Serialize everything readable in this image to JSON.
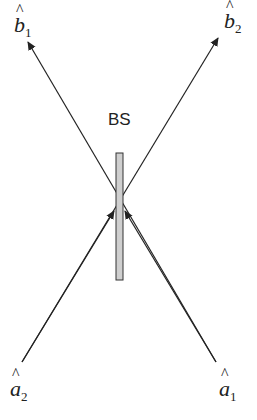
{
  "diagram": {
    "title_label": "BS",
    "component": "beam splitter",
    "outputs": [
      {
        "symbol": "b",
        "subscript": "1"
      },
      {
        "symbol": "b",
        "subscript": "2"
      }
    ],
    "inputs": [
      {
        "symbol": "a",
        "subscript": "2"
      },
      {
        "symbol": "a",
        "subscript": "1"
      }
    ],
    "colors": {
      "line": "#222222",
      "splitter_fill": "#cfcfcf",
      "splitter_stroke": "#333333"
    }
  }
}
